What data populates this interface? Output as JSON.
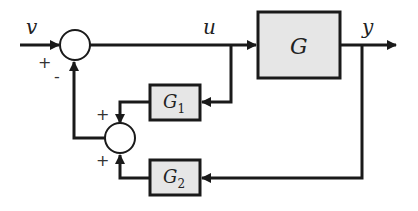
{
  "diagram": {
    "type": "block-diagram",
    "colors": {
      "line": "#1a1a1a",
      "block_fill": "#e6e6e6",
      "background": "#ffffff"
    },
    "signals": {
      "input": "v",
      "control": "u",
      "output": "y"
    },
    "blocks": [
      {
        "id": "G",
        "label": "G",
        "sub": ""
      },
      {
        "id": "G1",
        "label": "G",
        "sub": "1"
      },
      {
        "id": "G2",
        "label": "G",
        "sub": "2"
      }
    ],
    "junctions": [
      {
        "id": "sum1",
        "signs": {
          "left": "+",
          "bottom": "-"
        }
      },
      {
        "id": "sum2",
        "signs": {
          "top": "+",
          "bottom": "+"
        }
      }
    ]
  }
}
